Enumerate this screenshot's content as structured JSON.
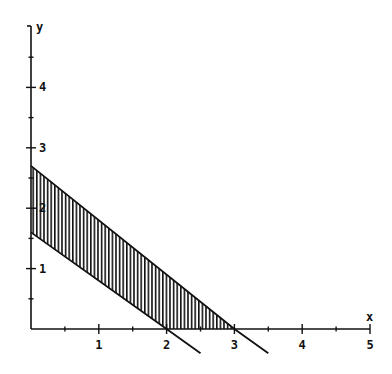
{
  "chart_data": {
    "type": "line",
    "title": "",
    "xlabel": "x",
    "ylabel": "y",
    "xlim": [
      0,
      5
    ],
    "ylim": [
      0,
      5
    ],
    "x_ticks": [
      1,
      2,
      3,
      4,
      5
    ],
    "x_tick_labels": [
      "1",
      "2",
      "3",
      "4",
      "5"
    ],
    "y_ticks": [
      1,
      2,
      3,
      4
    ],
    "y_tick_labels": [
      "1",
      "2",
      "3",
      "4"
    ],
    "minor_ticks_step": 0.5,
    "grid": false,
    "legend": null,
    "series": [
      {
        "name": "lower boundary line",
        "points": [
          [
            0,
            1.6
          ],
          [
            2,
            0
          ],
          [
            2.5,
            -0.4
          ]
        ],
        "equation_approx": "y = 1.6 - 0.8x"
      },
      {
        "name": "upper boundary line",
        "points": [
          [
            0,
            2.7
          ],
          [
            3,
            0
          ],
          [
            3.5,
            -0.4
          ]
        ],
        "equation_approx": "y = 2.7 - 0.9x"
      }
    ],
    "shaded_region": {
      "description": "region between the two lines in the first quadrant, vertical hatching",
      "vertices": [
        [
          0,
          1.6
        ],
        [
          0,
          2.7
        ],
        [
          3,
          0
        ],
        [
          2,
          0
        ]
      ],
      "pattern": "vertical-lines"
    }
  },
  "axes": {
    "x_label": "x",
    "y_label": "y"
  },
  "colors": {
    "ink": "#111111",
    "background": "#ffffff"
  }
}
